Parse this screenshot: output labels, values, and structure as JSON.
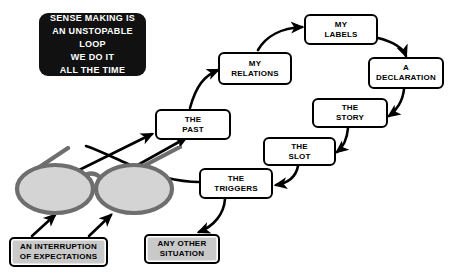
{
  "diagram": {
    "title_card": {
      "line1": "SENSE MAKING IS",
      "line2": "AN UNSTOPABLE LOOP",
      "line3": "WE DO IT",
      "line4": "ALL THE TIME"
    },
    "flow_nodes": [
      {
        "id": "the-past",
        "line1": "THE",
        "line2": "PAST"
      },
      {
        "id": "my-relations",
        "line1": "MY",
        "line2": "RELATIONS"
      },
      {
        "id": "my-labels",
        "line1": "MY",
        "line2": "LABELS"
      },
      {
        "id": "a-declaration",
        "line1": "A",
        "line2": "DECLARATION"
      },
      {
        "id": "the-story",
        "line1": "THE",
        "line2": "STORY"
      },
      {
        "id": "the-slot",
        "line1": "THE",
        "line2": "SLOT"
      },
      {
        "id": "the-triggers",
        "line1": "THE",
        "line2": "TRIGGERS"
      }
    ],
    "source_nodes": [
      {
        "id": "an-interruption-of-expectations",
        "line1": "AN INTERRUPTION",
        "line2": "OF EXPECTATIONS"
      },
      {
        "id": "any-other-situation",
        "line1": "ANY OTHER",
        "line2": "SITUATION"
      }
    ],
    "glasses": {
      "label": "eyeglasses-illustration",
      "lens_fill": "#d4d4d4",
      "rim_color": "#6e6e6e"
    },
    "colors": {
      "background": "#ffffff",
      "node_border": "#000000",
      "node_fill": "#ffffff",
      "source_fill": "#c9c9c9",
      "title_fill": "#111111",
      "title_text": "#ffffff",
      "arrow": "#000000"
    },
    "edges": [
      {
        "from": "an-interruption-of-expectations",
        "to": "glasses-left-lens"
      },
      {
        "from": "an-interruption-of-expectations",
        "to": "glasses-right-lens"
      },
      {
        "from": "any-other-situation",
        "to": "the-triggers"
      },
      {
        "from": "glasses",
        "to": "the-past"
      },
      {
        "from": "glasses",
        "to": "the-past"
      },
      {
        "from": "the-past",
        "to": "my-relations"
      },
      {
        "from": "my-relations",
        "to": "my-labels"
      },
      {
        "from": "my-labels",
        "to": "a-declaration"
      },
      {
        "from": "a-declaration",
        "to": "the-story"
      },
      {
        "from": "the-story",
        "to": "the-slot"
      },
      {
        "from": "the-slot",
        "to": "the-triggers"
      },
      {
        "from": "the-triggers",
        "to": "the-past"
      }
    ]
  }
}
